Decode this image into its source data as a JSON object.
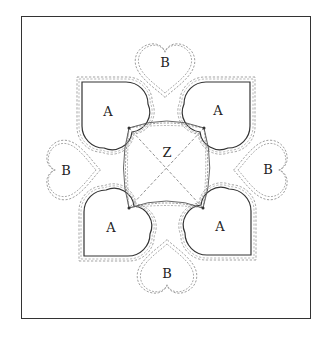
{
  "diagram": {
    "type": "quilt-block-pattern",
    "pieces": [
      {
        "id": "A-top-left",
        "label": "A",
        "shape": "heart",
        "x": 108,
        "y": 112
      },
      {
        "id": "A-top-right",
        "label": "A",
        "shape": "heart",
        "x": 218,
        "y": 111
      },
      {
        "id": "A-bottom-left",
        "label": "A",
        "shape": "heart",
        "x": 111,
        "y": 228
      },
      {
        "id": "A-bottom-right",
        "label": "A",
        "shape": "heart",
        "x": 220,
        "y": 227
      },
      {
        "id": "B-top",
        "label": "B",
        "shape": "heart",
        "x": 165,
        "y": 63
      },
      {
        "id": "B-left",
        "label": "B",
        "shape": "heart",
        "x": 66,
        "y": 171
      },
      {
        "id": "B-right",
        "label": "B",
        "shape": "heart",
        "x": 268,
        "y": 170
      },
      {
        "id": "B-bottom",
        "label": "B",
        "shape": "heart",
        "x": 167,
        "y": 274
      },
      {
        "id": "Z-center",
        "label": "Z",
        "shape": "curved-square",
        "x": 167,
        "y": 153
      }
    ],
    "colors": {
      "line": "#333333",
      "dash": "#888888",
      "background": "#ffffff"
    }
  }
}
